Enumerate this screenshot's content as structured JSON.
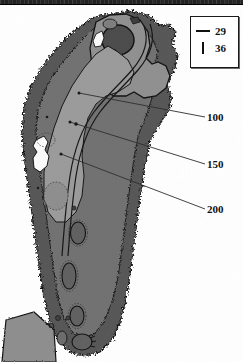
{
  "document": {
    "kind": "golf-hole-yardage-map",
    "orientation": "green-at-top",
    "background_color": "#ffffff",
    "scan_bar_color": "#222222"
  },
  "legend": {
    "border_color": "#1a1a1a",
    "rows": [
      {
        "symbol": "horizontal-dash",
        "value": "29"
      },
      {
        "symbol": "vertical-bar",
        "value": "36"
      }
    ]
  },
  "yardage_markers": [
    {
      "label": "100"
    },
    {
      "label": "150"
    },
    {
      "label": "200"
    }
  ],
  "palette": {
    "rough_dark": "#545454",
    "rough_mid": "#6f6f6f",
    "fairway_light": "#9a9a9a",
    "green_surface": "#8f8f8f",
    "green_inner": "#4a4a4a",
    "bunker_fill": "#5f5f5f",
    "hazard_white": "#fbfbfb",
    "tee_fill": "#8d8d8d",
    "outline": "#111111",
    "leader_line": "#2a2a2a"
  },
  "features": {
    "green": "putting-green",
    "fairway": "fairway-corridor",
    "rough": "tree-line-rough",
    "water_hazard": "hazard",
    "tee_box": "teeing-ground",
    "bunkers_count": 9
  }
}
